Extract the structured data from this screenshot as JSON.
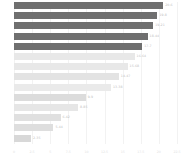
{
  "chart_data": {
    "type": "bar",
    "orientation": "horizontal",
    "title": "",
    "subtitle": "",
    "xlabel": "",
    "ylabel": "",
    "grid": true,
    "legend": null,
    "xlim": [
      0,
      22.5
    ],
    "categories": [
      "1",
      "2",
      "3",
      "4",
      "5",
      "6",
      "7",
      "8",
      "9",
      "10",
      "11",
      "12",
      "13",
      "14"
    ],
    "values": [
      20.6,
      19.8,
      19.21,
      18.44,
      17.7,
      16.64,
      15.68,
      14.47,
      13.38,
      9.9,
      8.85,
      6.42,
      5.44,
      2.35
    ],
    "data_labels": [
      "20.6",
      "19.8",
      "19.21",
      "18.44",
      "17.7",
      "16.64",
      "15.68",
      "14.47",
      "13.38",
      "9.9",
      "8.85",
      "6.42",
      "5.44",
      "2.35"
    ],
    "bar_colors": [
      "#6f6f6f",
      "#6f6f6f",
      "#6f6f6f",
      "#6f6f6f",
      "#6f6f6f",
      "#e8e8e8",
      "#e8e8e8",
      "#e3e3e3",
      "#eaeaea",
      "#dcdcdc",
      "#e6e6e6",
      "#e0e0e0",
      "#dedede",
      "#d8d8d8"
    ],
    "xticks": [
      0,
      2.5,
      5,
      7.5,
      10,
      12.5,
      15,
      17.5,
      20,
      22.5
    ],
    "xticklabels": [
      "0",
      "2.5",
      "5",
      "7.5",
      "10",
      "12.5",
      "15",
      "17.5",
      "20",
      "22.5"
    ],
    "label_color": "#bdbdbd",
    "tick_color": "#e2e2e2",
    "grid_color": "#f2f2f2",
    "background": "#ffffff"
  }
}
